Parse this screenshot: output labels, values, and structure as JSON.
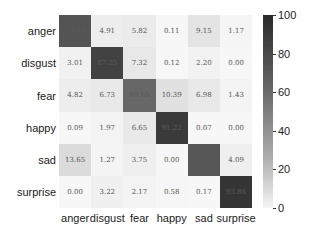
{
  "chart_data": {
    "type": "heatmap",
    "title": "",
    "xlabel": "",
    "ylabel": "",
    "row_labels": [
      "anger",
      "disgust",
      "fear",
      "happy",
      "sad",
      "surprise"
    ],
    "col_labels": [
      "anger",
      "disgust",
      "fear",
      "happy",
      "sad",
      "surprise"
    ],
    "values": [
      [
        78.84,
        4.91,
        5.82,
        0.11,
        9.15,
        1.17
      ],
      [
        3.01,
        87.35,
        7.32,
        0.12,
        2.2,
        0.0
      ],
      [
        4.82,
        6.73,
        69.65,
        10.39,
        6.98,
        1.43
      ],
      [
        0.09,
        1.97,
        6.65,
        91.22,
        0.07,
        0.0
      ],
      [
        13.65,
        1.27,
        3.75,
        0.0,
        77.24,
        4.09
      ],
      [
        0.0,
        3.22,
        2.17,
        0.58,
        0.17,
        93.86
      ]
    ],
    "value_format": "2 decimals",
    "colormap": "Greys",
    "colorbar": {
      "range": [
        0,
        100
      ],
      "ticks": [
        0,
        20,
        40,
        60,
        80,
        100
      ]
    },
    "grid": false,
    "legend_position": "right (colorbar)"
  }
}
